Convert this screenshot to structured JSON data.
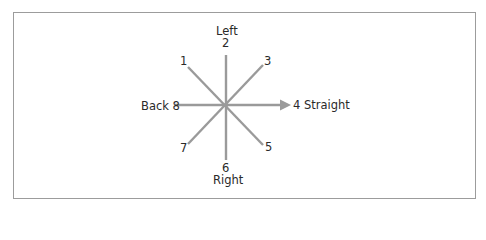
{
  "diagram": {
    "type": "direction-compass",
    "center": {
      "x": 226,
      "y": 105
    },
    "line_color": "#9a9a9a",
    "border_color": "#9c9c9c",
    "text_color": "#2a2a2a",
    "directions": [
      {
        "number": "1",
        "name": "",
        "angle_deg": 135
      },
      {
        "number": "2",
        "name": "Left",
        "angle_deg": 90
      },
      {
        "number": "3",
        "name": "",
        "angle_deg": 45
      },
      {
        "number": "4",
        "name": "Straight",
        "angle_deg": 0,
        "arrow": true
      },
      {
        "number": "5",
        "name": "",
        "angle_deg": -45
      },
      {
        "number": "6",
        "name": "Right",
        "angle_deg": -90
      },
      {
        "number": "7",
        "name": "",
        "angle_deg": -135
      },
      {
        "number": "8",
        "name": "Back",
        "angle_deg": 180
      }
    ]
  },
  "labels": {
    "left_name": "Left",
    "left_num": "2",
    "one": "1",
    "three": "3",
    "back": "Back 8",
    "straight": "4 Straight",
    "seven": "7",
    "five": "5",
    "right_num": "6",
    "right_name": "Right"
  }
}
